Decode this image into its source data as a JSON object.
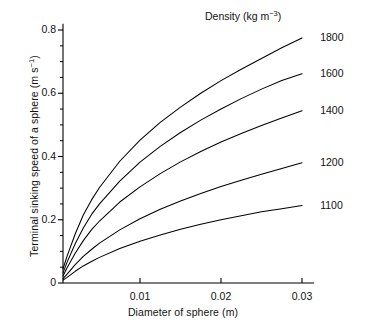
{
  "chart_data": {
    "type": "line",
    "title": "",
    "legend_title": "Density (kg m",
    "legend_title_sup": "−3",
    "legend_title_tail": ")",
    "xlabel": "Diameter of sphere (m)",
    "ylabel_main": "Terminal sinking speed of a sphere (m s",
    "ylabel_sup": "−1",
    "ylabel_tail": ")",
    "xlim": [
      0,
      0.0315
    ],
    "ylim": [
      0,
      0.82
    ],
    "grid": false,
    "legend_position": "right-inline-end-of-line",
    "xticks": [
      0.01,
      0.02,
      0.03
    ],
    "xtick_labels": [
      "0.01",
      "0.02",
      "0.03"
    ],
    "yticks": [
      0,
      0.2,
      0.4,
      0.6,
      0.8
    ],
    "ytick_labels": [
      "0",
      "0.2",
      "0.4",
      "0.6",
      "0.8"
    ],
    "yminor_step": 0.05,
    "x": [
      0.0005,
      0.001,
      0.002,
      0.003,
      0.004,
      0.005,
      0.0075,
      0.01,
      0.0125,
      0.015,
      0.0175,
      0.02,
      0.0225,
      0.025,
      0.0275,
      0.03
    ],
    "series": [
      {
        "name": "1800",
        "label": "1800",
        "values": [
          0.045,
          0.085,
          0.155,
          0.215,
          0.262,
          0.302,
          0.385,
          0.452,
          0.508,
          0.556,
          0.6,
          0.64,
          0.676,
          0.71,
          0.744,
          0.775
        ]
      },
      {
        "name": "1600",
        "label": "1600",
        "values": [
          0.032,
          0.066,
          0.124,
          0.174,
          0.216,
          0.25,
          0.322,
          0.382,
          0.432,
          0.476,
          0.515,
          0.55,
          0.583,
          0.613,
          0.64,
          0.662
        ]
      },
      {
        "name": "1400",
        "label": "1400",
        "values": [
          0.022,
          0.048,
          0.094,
          0.134,
          0.168,
          0.196,
          0.256,
          0.304,
          0.346,
          0.383,
          0.416,
          0.446,
          0.473,
          0.498,
          0.522,
          0.545
        ]
      },
      {
        "name": "1200",
        "label": "1200",
        "values": [
          0.014,
          0.028,
          0.058,
          0.084,
          0.106,
          0.126,
          0.168,
          0.203,
          0.233,
          0.259,
          0.283,
          0.305,
          0.325,
          0.344,
          0.362,
          0.38
        ]
      },
      {
        "name": "1100",
        "label": "1100",
        "values": [
          0.009,
          0.018,
          0.037,
          0.054,
          0.068,
          0.081,
          0.109,
          0.132,
          0.152,
          0.17,
          0.186,
          0.2,
          0.213,
          0.225,
          0.235,
          0.245
        ]
      }
    ],
    "colors": {
      "line": "#000000",
      "axis": "#000000",
      "text": "#111111",
      "background": "#ffffff"
    }
  }
}
